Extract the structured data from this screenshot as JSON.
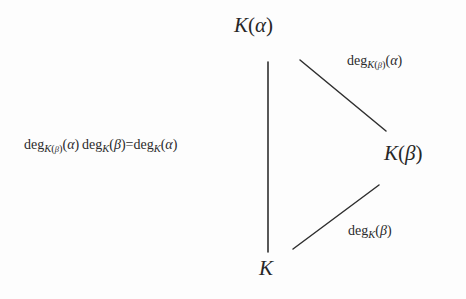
{
  "diagram": {
    "type": "field-extension-degree-triangle",
    "background_color": "#fdfdfd",
    "ink_color": "#2b2b2b",
    "nodes": [
      {
        "id": "k-alpha",
        "label": "K(α)",
        "x": 270,
        "y": 30
      },
      {
        "id": "k-beta",
        "label": "K(β)",
        "x": 412,
        "y": 157
      },
      {
        "id": "k",
        "label": "K",
        "x": 268,
        "y": 270
      }
    ],
    "edges": [
      {
        "id": "edge-k-alpha-k",
        "from": "k-alpha",
        "to": "k",
        "x1": 268,
        "y1": 62,
        "x2": 268,
        "y2": 252,
        "label_id": "left-equation"
      },
      {
        "id": "edge-k-alpha-k-beta",
        "from": "k-alpha",
        "to": "k-beta",
        "x1": 300,
        "y1": 60,
        "x2": 386,
        "y2": 131,
        "label_id": "top-right"
      },
      {
        "id": "edge-k-k-beta",
        "from": "k",
        "to": "k-beta",
        "x1": 293,
        "y1": 249,
        "x2": 379,
        "y2": 185,
        "label_id": "bottom-right"
      }
    ],
    "labels": {
      "left_equation": {
        "id": "left-equation",
        "text": "deg_{K(β)}(α) deg_K(β)=deg_K(α)",
        "fn1": "deg",
        "sub1_base": "K",
        "sub1_arg": "β",
        "arg1": "α",
        "fn2": "deg",
        "sub2": "K",
        "arg2": "β",
        "relation": "=",
        "fn3": "deg",
        "sub3": "K",
        "arg3": "α",
        "x": 24,
        "y": 145
      },
      "top_right": {
        "id": "top-right",
        "text": "deg_{K(β)}(α)",
        "fn": "deg",
        "sub_base": "K",
        "sub_arg": "β",
        "arg": "α",
        "x": 347,
        "y": 61
      },
      "bottom_right": {
        "id": "bottom-right",
        "text": "deg_K(β)",
        "fn": "deg",
        "sub": "K",
        "arg": "β",
        "x": 348,
        "y": 231
      }
    },
    "glyphs": {
      "alpha": "α",
      "beta": "β",
      "paren_open": "(",
      "paren_close": ")",
      "equals": "=",
      "field_k": "K"
    }
  }
}
